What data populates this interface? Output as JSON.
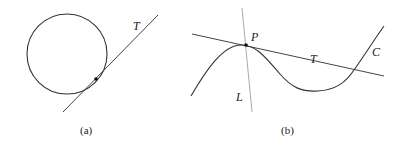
{
  "figure_a": {
    "caption": "(a)",
    "tangent_label": "T",
    "shapes": {
      "circle": {
        "cx": 67,
        "cy": 54,
        "r": 40
      },
      "tangent_line": {
        "x1": 63,
        "y1": 112,
        "x2": 158,
        "y2": 15
      },
      "tangent_point": {
        "x": 96,
        "y": 79
      }
    }
  },
  "figure_b": {
    "caption": "(b)",
    "point_label": "P",
    "tangent_label": "T",
    "curve_label": "C",
    "line_label": "L",
    "shapes": {
      "tangent_line": {
        "x1": 192,
        "y1": 34,
        "x2": 384,
        "y2": 76
      },
      "line_L": {
        "x1": 242,
        "y1": 8,
        "x2": 252,
        "y2": 112
      },
      "point_P": {
        "x": 246,
        "y": 45
      }
    }
  },
  "colors": {
    "stroke": "#333333",
    "light_stroke": "#999999"
  }
}
